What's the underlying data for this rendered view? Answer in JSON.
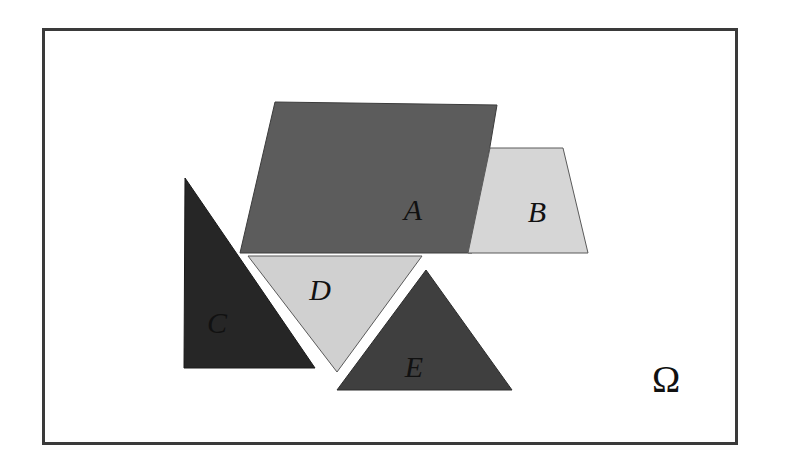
{
  "figure": {
    "canvas": {
      "width": 789,
      "height": 471
    },
    "background_color": "#ffffff",
    "frame": {
      "name": "universe-frame",
      "x": 42,
      "y": 28,
      "width": 696,
      "height": 417,
      "stroke_color": "#3a3a3a",
      "stroke_width": 3,
      "fill_color": "#ffffff"
    },
    "universe": {
      "symbol": "Ω",
      "x": 666,
      "y": 392,
      "font_size": 38,
      "color": "#111111"
    },
    "regions": [
      {
        "id": "A",
        "label": "A",
        "shape": "quadrilateral",
        "points": "275,102 497,105 472,253 240,253",
        "fill_color": "#5c5c5c",
        "stroke_color": "#3c3c3c",
        "stroke_width": 1,
        "label_x": 413,
        "label_y": 220,
        "label_color": "#101010"
      },
      {
        "id": "B",
        "label": "B",
        "shape": "trapezoid",
        "points": "490,148 563,148 588,253 468,253",
        "fill_color": "#d6d6d6",
        "stroke_color": "#5a5a5a",
        "stroke_width": 1,
        "label_x": 537,
        "label_y": 222,
        "label_color": "#101010"
      },
      {
        "id": "C",
        "label": "C",
        "shape": "right-triangle",
        "points": "185,178 184,368 315,368",
        "fill_color": "#262626",
        "stroke_color": "#1a1a1a",
        "stroke_width": 1,
        "label_x": 217,
        "label_y": 333,
        "label_color": "#0a0a0a"
      },
      {
        "id": "D",
        "label": "D",
        "shape": "inverted-triangle",
        "points": "248,256 422,256 337,372",
        "fill_color": "#d0d0d0",
        "stroke_color": "#5a5a5a",
        "stroke_width": 1,
        "label_x": 320,
        "label_y": 300,
        "label_color": "#101010"
      },
      {
        "id": "E",
        "label": "E",
        "shape": "triangle",
        "points": "426,270 512,390 337,390",
        "fill_color": "#3f3f3f",
        "stroke_color": "#2c2c2c",
        "stroke_width": 1,
        "label_x": 414,
        "label_y": 377,
        "label_color": "#0a0a0a"
      }
    ]
  }
}
